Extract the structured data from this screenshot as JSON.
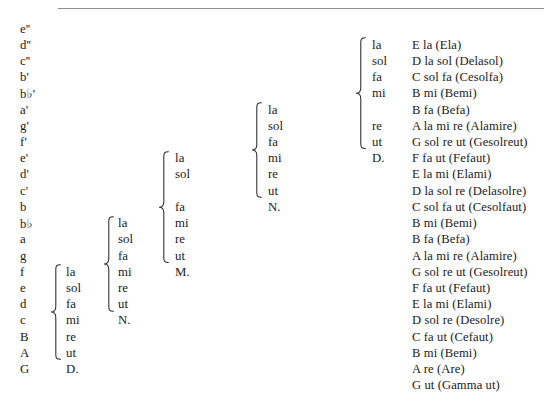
{
  "figure": {
    "kind": "gamut-hexachord-table",
    "row_count": 22,
    "rule_color": "#8e8e8e"
  },
  "pitches": [
    {
      "name": "e''",
      "base": "e",
      "flat": false,
      "primes": "''"
    },
    {
      "name": "d''",
      "base": "d",
      "flat": false,
      "primes": "''"
    },
    {
      "name": "c''",
      "base": "c",
      "flat": false,
      "primes": "''"
    },
    {
      "name": "b'",
      "base": "b",
      "flat": false,
      "primes": "'"
    },
    {
      "name": "b♭'",
      "base": "b",
      "flat": true,
      "primes": "'"
    },
    {
      "name": "a'",
      "base": "a",
      "flat": false,
      "primes": "'"
    },
    {
      "name": "g'",
      "base": "g",
      "flat": false,
      "primes": "'"
    },
    {
      "name": "f'",
      "base": "f",
      "flat": false,
      "primes": "'"
    },
    {
      "name": "e'",
      "base": "e",
      "flat": false,
      "primes": "'"
    },
    {
      "name": "d'",
      "base": "d",
      "flat": false,
      "primes": "'"
    },
    {
      "name": "c'",
      "base": "c",
      "flat": false,
      "primes": "'"
    },
    {
      "name": "b",
      "base": "b",
      "flat": false,
      "primes": ""
    },
    {
      "name": "b♭",
      "base": "b",
      "flat": true,
      "primes": ""
    },
    {
      "name": "a",
      "base": "a",
      "flat": false,
      "primes": ""
    },
    {
      "name": "g",
      "base": "g",
      "flat": false,
      "primes": ""
    },
    {
      "name": "f",
      "base": "f",
      "flat": false,
      "primes": ""
    },
    {
      "name": "e",
      "base": "e",
      "flat": false,
      "primes": ""
    },
    {
      "name": "d",
      "base": "d",
      "flat": false,
      "primes": ""
    },
    {
      "name": "c",
      "base": "c",
      "flat": false,
      "primes": ""
    },
    {
      "name": "B",
      "base": "B",
      "flat": false,
      "primes": ""
    },
    {
      "name": "A",
      "base": "A",
      "flat": false,
      "primes": ""
    },
    {
      "name": "G",
      "base": "G",
      "flat": false,
      "primes": ""
    }
  ],
  "hexachords": [
    {
      "id": "hexachord-1",
      "label": "D.",
      "start_row": 16,
      "syllables": [
        {
          "row": 16,
          "text": "la"
        },
        {
          "row": 17,
          "text": "sol"
        },
        {
          "row": 18,
          "text": "fa"
        },
        {
          "row": 19,
          "text": "mi"
        },
        {
          "row": 20,
          "text": "re"
        },
        {
          "row": 21,
          "text": "ut"
        },
        {
          "row": 22,
          "text": "D."
        }
      ]
    },
    {
      "id": "hexachord-2",
      "label": "N.",
      "start_row": 13,
      "syllables": [
        {
          "row": 13,
          "text": "la"
        },
        {
          "row": 14,
          "text": "sol"
        },
        {
          "row": 15,
          "text": "fa"
        },
        {
          "row": 16,
          "text": "mi"
        },
        {
          "row": 17,
          "text": "re"
        },
        {
          "row": 18,
          "text": "ut"
        },
        {
          "row": 19,
          "text": "N."
        }
      ]
    },
    {
      "id": "hexachord-3",
      "label": "M.",
      "start_row": 9,
      "syllables": [
        {
          "row": 9,
          "text": "la"
        },
        {
          "row": 10,
          "text": "sol"
        },
        {
          "row": 12,
          "text": "fa"
        },
        {
          "row": 13,
          "text": "mi"
        },
        {
          "row": 14,
          "text": "re"
        },
        {
          "row": 15,
          "text": "ut"
        },
        {
          "row": 16,
          "text": "M."
        }
      ]
    },
    {
      "id": "hexachord-4",
      "label": "N.",
      "start_row": 6,
      "syllables": [
        {
          "row": 6,
          "text": "la"
        },
        {
          "row": 7,
          "text": "sol"
        },
        {
          "row": 8,
          "text": "fa"
        },
        {
          "row": 9,
          "text": "mi"
        },
        {
          "row": 10,
          "text": "re"
        },
        {
          "row": 11,
          "text": "ut"
        },
        {
          "row": 12,
          "text": "N."
        }
      ]
    },
    {
      "id": "hexachord-5",
      "label": "D.",
      "start_row": 2,
      "syllables": [
        {
          "row": 2,
          "text": "la"
        },
        {
          "row": 3,
          "text": "sol"
        },
        {
          "row": 4,
          "text": "fa"
        },
        {
          "row": 5,
          "text": "mi"
        },
        {
          "row": 7,
          "text": "re"
        },
        {
          "row": 8,
          "text": "ut"
        },
        {
          "row": 9,
          "text": "D."
        }
      ]
    }
  ],
  "gamut_names": [
    {
      "row": 2,
      "text": "E la (Ela)"
    },
    {
      "row": 3,
      "text": "D la sol (Delasol)"
    },
    {
      "row": 4,
      "text": "C sol fa (Cesolfa)"
    },
    {
      "row": 5,
      "text": "B mi (Bemi)"
    },
    {
      "row": 6,
      "text": "B fa (Befa)"
    },
    {
      "row": 7,
      "text": "A la mi re (Alamire)"
    },
    {
      "row": 8,
      "text": "G sol re ut (Gesolreut)"
    },
    {
      "row": 9,
      "text": "F fa ut (Fefaut)"
    },
    {
      "row": 10,
      "text": "E la mi (Elami)"
    },
    {
      "row": 11,
      "text": "D la sol re (Delasolre)"
    },
    {
      "row": 12,
      "text": "C sol fa ut (Cesolfaut)"
    },
    {
      "row": 13,
      "text": "B mi (Bemi)"
    },
    {
      "row": 14,
      "text": "B fa (Befa)"
    },
    {
      "row": 15,
      "text": "A la mi re (Alamire)"
    },
    {
      "row": 16,
      "text": "G sol re ut (Gesolreut)"
    },
    {
      "row": 17,
      "text": "F fa ut (Fefaut)"
    },
    {
      "row": 18,
      "text": "E la mi (Elami)"
    },
    {
      "row": 19,
      "text": "D sol re (Desolre)"
    },
    {
      "row": 20,
      "text": "C fa ut (Cefaut)"
    },
    {
      "row": 21,
      "text": "B mi (Bemi)"
    },
    {
      "row": 22,
      "text": "A re (Are)"
    },
    {
      "row": 23,
      "text": "G ut (Gamma ut)"
    }
  ]
}
